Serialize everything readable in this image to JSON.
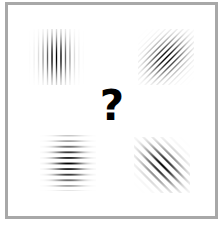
{
  "diagram": {
    "center_label": "?",
    "border_color": "#a8a8a8",
    "background": "#ffffff",
    "patches": [
      {
        "id": "top-left",
        "orientation_deg": 90,
        "description": "vertical stripes",
        "cx": 56,
        "cy": 57,
        "freq": 4.5,
        "sigma_x": 9,
        "sigma_y": 14
      },
      {
        "id": "top-right",
        "orientation_deg": 45,
        "description": "diagonal stripes, rising",
        "cx": 166,
        "cy": 57,
        "freq": 4.2,
        "sigma_x": 10,
        "sigma_y": 14
      },
      {
        "id": "bottom-left",
        "orientation_deg": 0,
        "description": "horizontal stripes",
        "cx": 68,
        "cy": 163,
        "freq": 5.6,
        "sigma_x": 16,
        "sigma_y": 10
      },
      {
        "id": "bottom-right",
        "orientation_deg": 135,
        "description": "diagonal stripes, falling, lower frequency",
        "cx": 162,
        "cy": 165,
        "freq": 6.5,
        "sigma_x": 10,
        "sigma_y": 15
      }
    ]
  }
}
